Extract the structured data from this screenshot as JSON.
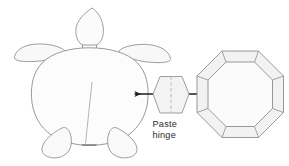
{
  "diagram": {
    "background_color": "#ffffff",
    "stroke_color": "#8a8a8a",
    "fill_color": "#f7f7f7",
    "fold_line_color": "#b9b9b9",
    "arrow_color": "#1d1d1d",
    "text_color": "#2b2b2b"
  },
  "labels": {
    "paste_hinge_line1": "Paste",
    "paste_hinge_line2": "hinge"
  },
  "parts": {
    "turtle": {
      "name": "turtle-body-template",
      "components": [
        "head",
        "neck",
        "front-flipper-left",
        "front-flipper-right",
        "shell",
        "rear-flipper-left",
        "rear-flipper-right",
        "shell-center-line"
      ]
    },
    "hinge": {
      "name": "paste-hinge-piece",
      "shape": "hexagon",
      "fold_line": "vertical-dashed"
    },
    "octagon": {
      "name": "octagon-shell-template",
      "outer_shape": "octagon",
      "inner_shape": "octagon",
      "flap_count": 8
    }
  },
  "arrows": {
    "left": {
      "name": "arrow-to-turtle",
      "direction": "left"
    },
    "right": {
      "name": "arrow-to-octagon",
      "direction": "right"
    }
  }
}
